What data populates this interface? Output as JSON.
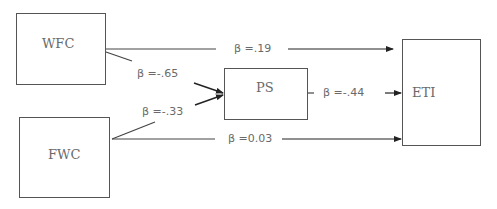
{
  "diagram": {
    "type": "path-model",
    "nodes": [
      {
        "id": "WFC",
        "label": "WFC"
      },
      {
        "id": "FWC",
        "label": "FWC"
      },
      {
        "id": "PS",
        "label": "PS"
      },
      {
        "id": "ETI",
        "label": "ETI"
      }
    ],
    "edges": [
      {
        "from": "WFC",
        "to": "ETI",
        "label": "β =.19"
      },
      {
        "from": "WFC",
        "to": "PS",
        "label": "β =-.65"
      },
      {
        "from": "FWC",
        "to": "PS",
        "label": "β =-.33"
      },
      {
        "from": "PS",
        "to": "ETI",
        "label": "β =-.44"
      },
      {
        "from": "FWC",
        "to": "ETI",
        "label": "β =0.03"
      }
    ],
    "colors": {
      "line": "#333333",
      "box_border": "#555555",
      "text": "#6a6a6a"
    }
  }
}
